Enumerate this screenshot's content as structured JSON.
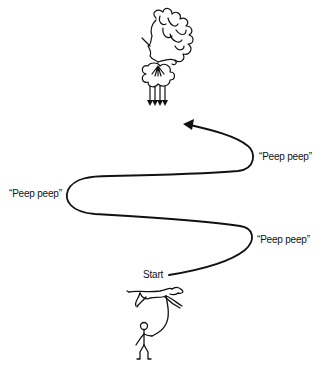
{
  "diagram": {
    "labels": {
      "start": "Start",
      "turn_1": "“Peep peep”",
      "turn_2": "“Peep peep”",
      "turn_3": "“Peep peep”"
    },
    "figures": {
      "top": "wind-god-cloud-figure",
      "bottom": "person-walking-dog"
    },
    "colors": {
      "ink": "#111111",
      "background": "#ffffff"
    }
  }
}
